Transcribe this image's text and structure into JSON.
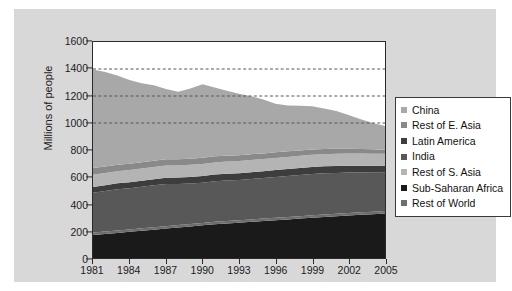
{
  "chart_data": {
    "type": "area",
    "stacked": true,
    "title": "",
    "xlabel": "",
    "ylabel": "Millions of people",
    "ylim": [
      0,
      1600
    ],
    "ytick_values": [
      0,
      200,
      400,
      600,
      800,
      1000,
      1200,
      1400,
      1600
    ],
    "ytick_labels": [
      "0",
      "200",
      "400",
      "600",
      "800",
      "1000",
      "1200",
      "1400",
      "1600"
    ],
    "xlim": [
      1981,
      2005
    ],
    "x": [
      1981,
      1982,
      1983,
      1984,
      1985,
      1986,
      1987,
      1988,
      1989,
      1990,
      1991,
      1992,
      1993,
      1994,
      1995,
      1996,
      1997,
      1998,
      1999,
      2000,
      2001,
      2002,
      2003,
      2004,
      2005
    ],
    "xtick_values": [
      1981,
      1984,
      1987,
      1990,
      1993,
      1996,
      1999,
      2002,
      2005
    ],
    "xtick_labels": [
      "1981",
      "1984",
      "1987",
      "1990",
      "1993",
      "1996",
      "1999",
      "2002",
      "2005"
    ],
    "grid": false,
    "reference_lines": [
      {
        "value": 1400,
        "style": "dashed"
      },
      {
        "value": 1200,
        "style": "dashed"
      },
      {
        "value": 1000,
        "style": "dashed"
      }
    ],
    "legend_position": "right",
    "stack_order_bottom_to_top": [
      "Sub-Saharan Africa",
      "Rest of World",
      "India",
      "Latin America",
      "Rest of S. Asia",
      "Rest of E. Asia",
      "China"
    ],
    "series": [
      {
        "name": "China",
        "color": "#a8a8a8",
        "values": [
          730,
          700,
          660,
          620,
          585,
          560,
          520,
          500,
          520,
          545,
          510,
          480,
          455,
          430,
          400,
          360,
          340,
          330,
          320,
          300,
          280,
          250,
          220,
          195,
          175
        ]
      },
      {
        "name": "Rest of E. Asia",
        "color": "#898989",
        "values": [
          50,
          48,
          48,
          47,
          47,
          46,
          46,
          45,
          45,
          45,
          45,
          44,
          44,
          43,
          42,
          42,
          41,
          40,
          40,
          38,
          37,
          36,
          34,
          32,
          30
        ]
      },
      {
        "name": "Latin America",
        "color": "#3d3d3d",
        "values": [
          42,
          43,
          44,
          45,
          45,
          46,
          47,
          47,
          48,
          49,
          50,
          50,
          50,
          50,
          51,
          51,
          51,
          52,
          52,
          52,
          52,
          51,
          50,
          48,
          46
        ]
      },
      {
        "name": "India",
        "color": "#585858",
        "values": [
          296,
          300,
          305,
          305,
          308,
          310,
          312,
          305,
          300,
          298,
          300,
          300,
          298,
          300,
          300,
          302,
          304,
          305,
          306,
          305,
          302,
          300,
          296,
          292,
          288
        ]
      },
      {
        "name": "Rest of S. Asia",
        "color": "#b4b4b4",
        "values": [
          90,
          90,
          90,
          90,
          90,
          90,
          90,
          90,
          90,
          90,
          90,
          90,
          90,
          90,
          90,
          90,
          90,
          90,
          90,
          90,
          90,
          90,
          90,
          90,
          90
        ]
      },
      {
        "name": "Sub-Saharan Africa",
        "color": "#1a1a1a",
        "values": [
          170,
          178,
          186,
          194,
          202,
          210,
          218,
          226,
          234,
          242,
          250,
          256,
          262,
          268,
          274,
          280,
          286,
          292,
          298,
          304,
          310,
          315,
          320,
          325,
          330
        ]
      },
      {
        "name": "Rest of World",
        "color": "#6e6e6e",
        "values": [
          18,
          18,
          18,
          18,
          18,
          18,
          18,
          18,
          18,
          18,
          18,
          18,
          18,
          18,
          18,
          18,
          18,
          18,
          18,
          18,
          18,
          18,
          18,
          18,
          18
        ]
      }
    ]
  },
  "legend": {
    "items": [
      {
        "label": "China",
        "color": "#a8a8a8"
      },
      {
        "label": "Rest of E. Asia",
        "color": "#898989"
      },
      {
        "label": "Latin America",
        "color": "#3d3d3d"
      },
      {
        "label": "India",
        "color": "#585858"
      },
      {
        "label": "Rest of S. Asia",
        "color": "#b4b4b4"
      },
      {
        "label": "Sub-Saharan Africa",
        "color": "#1a1a1a"
      },
      {
        "label": "Rest of World",
        "color": "#6e6e6e"
      }
    ]
  },
  "colors": {
    "figure_background": "#ffffff",
    "panel_background": "#d8d8d8",
    "plot_background": "#ffffff",
    "axis": "#2a2a2a",
    "text": "#1c1c1c",
    "reference_line": "#555555"
  }
}
